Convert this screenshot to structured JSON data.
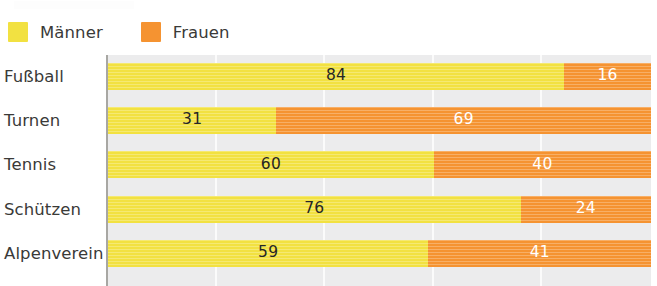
{
  "legend": {
    "items": [
      {
        "label": "Männer",
        "color": "#f2e141",
        "icon": "legend-swatch-male"
      },
      {
        "label": "Frauen",
        "color": "#f59331",
        "icon": "legend-swatch-female"
      }
    ]
  },
  "colors": {
    "male": "#f2e141",
    "female": "#f59331",
    "plot_background": "#ececed",
    "gridline": "#fbfbfb",
    "axis": "#a8a7a3",
    "label_text": "#3a3a38",
    "value_text_dark": "#262624",
    "value_text_light": "#ffffff"
  },
  "chart_data": {
    "type": "bar",
    "title": "",
    "subtitle": "",
    "xlabel": "",
    "ylabel": "",
    "orientation": "horizontal",
    "stacked": true,
    "stacked_total": 100,
    "xlim": [
      0,
      100
    ],
    "grid": true,
    "gridlines": [
      0,
      20,
      40,
      60,
      80,
      100
    ],
    "legend_position": "top-left",
    "categories": [
      "Fußball",
      "Turnen",
      "Tennis",
      "Schützen",
      "Alpenverein"
    ],
    "series": [
      {
        "name": "Männer",
        "color": "#f2e141",
        "values": [
          84,
          31,
          60,
          76,
          59
        ]
      },
      {
        "name": "Frauen",
        "color": "#f59331",
        "values": [
          16,
          69,
          40,
          24,
          41
        ]
      }
    ],
    "rows": [
      {
        "category": "Fußball",
        "male": 84,
        "female": 16,
        "male_label": "84",
        "female_label": "16"
      },
      {
        "category": "Turnen",
        "male": 31,
        "female": 69,
        "male_label": "31",
        "female_label": "69"
      },
      {
        "category": "Tennis",
        "male": 60,
        "female": 40,
        "male_label": "60",
        "female_label": "40"
      },
      {
        "category": "Schützen",
        "male": 76,
        "female": 24,
        "male_label": "76",
        "female_label": "24"
      },
      {
        "category": "Alpenverein",
        "male": 59,
        "female": 41,
        "male_label": "59",
        "female_label": "41"
      }
    ]
  }
}
